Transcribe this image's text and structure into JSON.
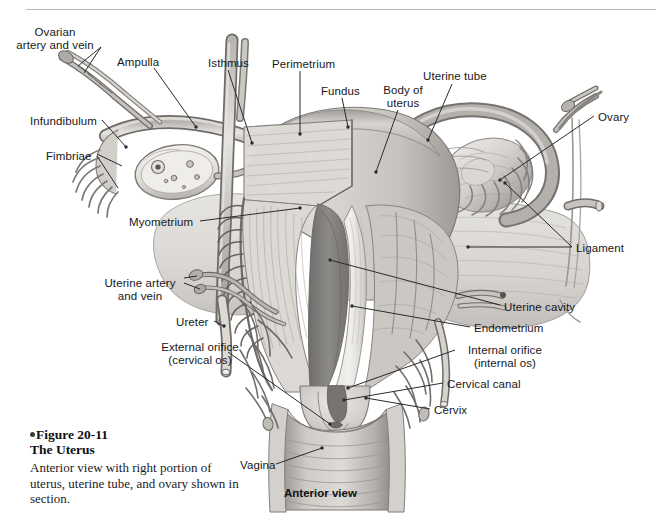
{
  "figure": {
    "number": "Figure 20-11",
    "title": "The Uterus",
    "caption": "Anterior view with right portion of uterus, uterine tube, and ovary shown in section.",
    "view_caption": "Anterior view"
  },
  "colors": {
    "ink": "#17171a",
    "leader_line": "#2a2a2e",
    "rule": "#b9b9bc",
    "page_background": "#ffffff",
    "tissue_light": "#e9e7e3",
    "tissue_mid": "#c3c1bd",
    "tissue_dark": "#8e8c89",
    "cavity_shadow": "#7f7d7b"
  },
  "labels": [
    {
      "id": "ovarian-artery-and-vein",
      "text": "Ovarian\nartery and vein",
      "x": 44,
      "y": 26,
      "align": "center"
    },
    {
      "id": "ampulla",
      "text": "Ampulla",
      "x": 117,
      "y": 56,
      "align": "left"
    },
    {
      "id": "isthmus",
      "text": "Isthmus",
      "x": 208,
      "y": 57,
      "align": "left"
    },
    {
      "id": "perimetrium",
      "text": "Perimetrium",
      "x": 272,
      "y": 58,
      "align": "left"
    },
    {
      "id": "fundus",
      "text": "Fundus",
      "x": 321,
      "y": 85,
      "align": "left"
    },
    {
      "id": "body-of-uterus",
      "text": "Body of\nuterus",
      "x": 377,
      "y": 84,
      "align": "left"
    },
    {
      "id": "uterine-tube",
      "text": "Uterine tube",
      "x": 423,
      "y": 70,
      "align": "left"
    },
    {
      "id": "ovary",
      "text": "Ovary",
      "x": 598,
      "y": 111,
      "align": "left"
    },
    {
      "id": "infundibulum",
      "text": "Infundibulum",
      "x": 30,
      "y": 115,
      "align": "left"
    },
    {
      "id": "fimbriae",
      "text": "Fimbriae",
      "x": 46,
      "y": 150,
      "align": "left"
    },
    {
      "id": "myometrium",
      "text": "Myometrium",
      "x": 129,
      "y": 216,
      "align": "left"
    },
    {
      "id": "ligament",
      "text": "Ligament",
      "x": 576,
      "y": 242,
      "align": "left"
    },
    {
      "id": "uterine-artery-and-vein",
      "text": "Uterine artery\nand vein",
      "x": 101,
      "y": 277,
      "align": "left"
    },
    {
      "id": "uterine-cavity",
      "text": "Uterine cavity",
      "x": 504,
      "y": 301,
      "align": "left"
    },
    {
      "id": "ureter",
      "text": "Ureter",
      "x": 176,
      "y": 316,
      "align": "left"
    },
    {
      "id": "endometrium",
      "text": "Endometrium",
      "x": 474,
      "y": 322,
      "align": "left"
    },
    {
      "id": "internal-orifice",
      "text": "Internal orifice\n(internal os)",
      "x": 459,
      "y": 344,
      "align": "left"
    },
    {
      "id": "external-orifice",
      "text": "External orifice\n(cervical os)",
      "x": 152,
      "y": 341,
      "align": "left"
    },
    {
      "id": "cervical-canal",
      "text": "Cervical canal",
      "x": 447,
      "y": 378,
      "align": "left"
    },
    {
      "id": "cervix",
      "text": "Cervix",
      "x": 434,
      "y": 404,
      "align": "left"
    },
    {
      "id": "vagina",
      "text": "Vagina",
      "x": 240,
      "y": 459,
      "align": "left"
    }
  ]
}
